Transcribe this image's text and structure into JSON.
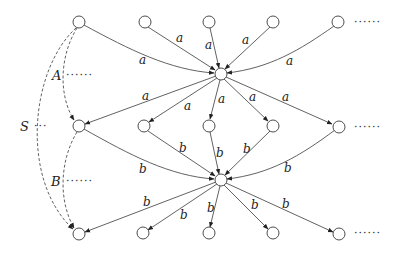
{
  "diagram": {
    "type": "directed-graph",
    "edge_label_a": "a",
    "edge_label_b": "b",
    "set_labels": {
      "S": "S",
      "A": "A",
      "B": "B"
    },
    "ellipsis": {
      "short": "···",
      "long": "······"
    },
    "nodes": {
      "top_row": 5,
      "hub_a": 1,
      "middle_row": 5,
      "hub_b": 1,
      "bottom_row": 5
    },
    "edges": [
      {
        "from": "top",
        "to": "hub_a",
        "label": "a",
        "count": 5
      },
      {
        "from": "hub_a",
        "to": "middle",
        "label": "a",
        "count": 5
      },
      {
        "from": "middle",
        "to": "hub_b",
        "label": "b",
        "count": 5
      },
      {
        "from": "hub_b",
        "to": "bottom",
        "label": "b",
        "count": 5
      },
      {
        "from": "top_left",
        "to": "middle_left",
        "label": "A",
        "style": "dashed"
      },
      {
        "from": "middle_left",
        "to": "bottom_left",
        "label": "B",
        "style": "dashed"
      },
      {
        "from": "top_left",
        "to": "bottom_left",
        "label": "S",
        "style": "dashed"
      }
    ]
  }
}
